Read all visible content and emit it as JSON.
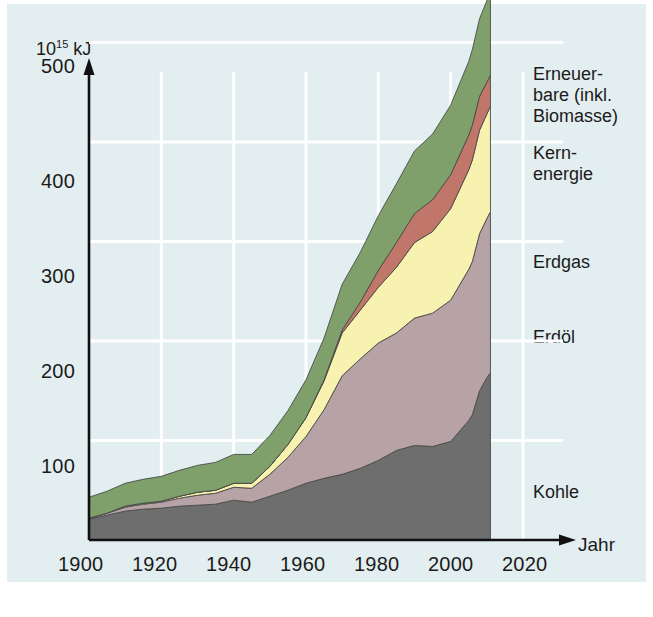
{
  "figure": {
    "background_color": "#ffffff",
    "panel_color": "#e3eef0",
    "grid_color": "#ffffff",
    "axis_color": "#111111"
  },
  "axes": {
    "y_unit_label_base": "10",
    "y_unit_label_exp": "15",
    "y_unit_label_suffix": " kJ",
    "x_title": "Jahr",
    "y_ticks": [
      "100",
      "200",
      "300",
      "400",
      "500"
    ],
    "y_tick_values": [
      100,
      200,
      300,
      400,
      500
    ],
    "x_ticks": [
      "1900",
      "1920",
      "1940",
      "1960",
      "1980",
      "2000",
      "2020"
    ],
    "x_tick_values": [
      1900,
      1920,
      1940,
      1960,
      1980,
      2000,
      2020
    ],
    "xlim": [
      1900,
      2025
    ],
    "ylim": [
      0,
      545
    ]
  },
  "legend": {
    "items": [
      {
        "key": "renewables",
        "label": "Erneuer-\nbare (inkl.\nBiomasse)",
        "color": "#7fa06a"
      },
      {
        "key": "nuclear",
        "label": "Kern-\nenergie",
        "color": "#c0776a"
      },
      {
        "key": "gas",
        "label": "Erdgas",
        "color": "#f7f2b0"
      },
      {
        "key": "oil",
        "label": "Erdöl",
        "color": "#b7a2a6"
      },
      {
        "key": "coal",
        "label": "Kohle",
        "color": "#6e6e6e"
      }
    ]
  },
  "chart_data": {
    "type": "area",
    "stacked": true,
    "title": "",
    "subtitle": "",
    "xlabel": "Jahr",
    "ylabel": "10^15 kJ",
    "ylim": [
      0,
      545
    ],
    "xlim": [
      1900,
      2025
    ],
    "grid": true,
    "legend_position": "right",
    "x": [
      1900,
      1905,
      1910,
      1915,
      1920,
      1925,
      1930,
      1935,
      1940,
      1945,
      1950,
      1955,
      1960,
      1965,
      1970,
      1975,
      1980,
      1985,
      1990,
      1995,
      2000,
      2005,
      2006,
      2008,
      2010,
      2011
    ],
    "series": [
      {
        "name": "Kohle",
        "key": "coal",
        "color": "#6e6e6e",
        "values": [
          21,
          25,
          29,
          31,
          32,
          34,
          35,
          36,
          40,
          38,
          44,
          50,
          57,
          62,
          66,
          72,
          80,
          90,
          95,
          94,
          99,
          120,
          126,
          150,
          163,
          168
        ]
      },
      {
        "name": "Erdöl",
        "key": "oil",
        "color": "#b7a2a6",
        "values": [
          1,
          2,
          4,
          5,
          6,
          8,
          10,
          11,
          13,
          14,
          22,
          33,
          47,
          69,
          99,
          110,
          118,
          118,
          128,
          134,
          142,
          152,
          154,
          158,
          160,
          162
        ]
      },
      {
        "name": "Erdgas",
        "key": "gas",
        "color": "#f7f2b0",
        "values": [
          0,
          0,
          1,
          1,
          1,
          2,
          3,
          3,
          4,
          5,
          8,
          13,
          19,
          29,
          43,
          49,
          56,
          66,
          76,
          82,
          92,
          100,
          102,
          104,
          105,
          106
        ]
      },
      {
        "name": "Kernenergie",
        "key": "nuclear",
        "color": "#c0776a",
        "values": [
          0,
          0,
          0,
          0,
          0,
          0,
          0,
          0,
          0,
          0,
          0,
          0,
          0,
          1,
          3,
          8,
          17,
          25,
          29,
          32,
          34,
          35,
          35,
          34,
          32,
          31
        ]
      },
      {
        "name": "Erneuerbare (inkl. Biomasse)",
        "key": "renewables",
        "color": "#7fa06a",
        "values": [
          21,
          22,
          23,
          24,
          25,
          26,
          27,
          28,
          29,
          29,
          31,
          34,
          38,
          42,
          46,
          50,
          55,
          59,
          63,
          66,
          70,
          74,
          76,
          78,
          82,
          85
        ]
      }
    ],
    "totals": [
      43,
      49,
      57,
      61,
      64,
      70,
      75,
      78,
      86,
      86,
      105,
      130,
      161,
      203,
      257,
      289,
      326,
      358,
      391,
      408,
      437,
      481,
      493,
      524,
      542,
      552
    ]
  }
}
